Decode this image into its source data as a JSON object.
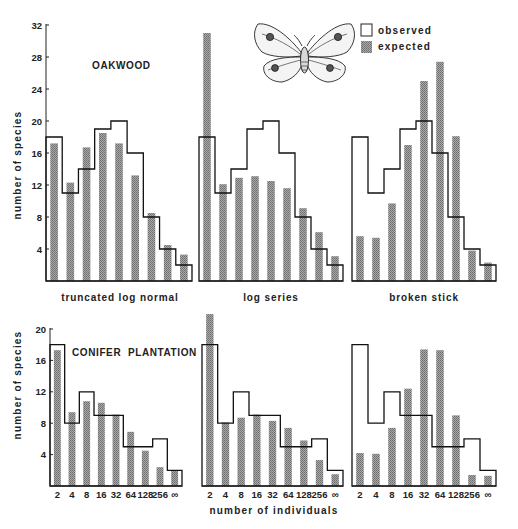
{
  "figure": {
    "top_caption_partial": "",
    "x_axis_title": "number of individuals",
    "y_axis_title": "number of species",
    "footer_caption_partial": ""
  },
  "legend": {
    "observed_label": "observed",
    "expected_label": "expected"
  },
  "rows": [
    {
      "site_label": "OAKWOOD",
      "y_ticks": [
        4,
        8,
        12,
        16,
        20,
        24,
        28,
        32
      ],
      "ymax": 32
    },
    {
      "site_label": "CONIFER  PLANTATION",
      "y_ticks": [
        4,
        8,
        12,
        16,
        20
      ],
      "ymax": 20
    }
  ],
  "model_labels": [
    "truncated log normal",
    "log series",
    "broken stick"
  ],
  "x_tick_labels": [
    "2",
    "4",
    "8",
    "16",
    "32",
    "64",
    "128",
    "256",
    "∞"
  ],
  "colors": {
    "expected_bar": "#8f8f8f",
    "observed_line": "#111111",
    "axis": "#222222"
  },
  "chart_data": [
    {
      "type": "bar",
      "title": "OAKWOOD – truncated log normal",
      "categories": [
        "2",
        "4",
        "8",
        "16",
        "32",
        "64",
        "128",
        "256",
        "∞"
      ],
      "series": [
        {
          "name": "observed",
          "values": [
            18,
            11,
            14,
            19,
            20,
            16,
            8,
            4,
            2
          ]
        },
        {
          "name": "expected",
          "values": [
            17.2,
            12.3,
            16.7,
            18.5,
            17.2,
            13.2,
            8.5,
            4.5,
            3.3
          ]
        }
      ],
      "xlabel": "number of individuals",
      "ylabel": "number of species",
      "ylim": [
        0,
        32
      ]
    },
    {
      "type": "bar",
      "title": "OAKWOOD – log series",
      "categories": [
        "2",
        "4",
        "8",
        "16",
        "32",
        "64",
        "128",
        "256",
        "∞"
      ],
      "series": [
        {
          "name": "observed",
          "values": [
            18,
            11,
            14,
            19,
            20,
            16,
            8,
            4,
            2
          ]
        },
        {
          "name": "expected",
          "values": [
            31,
            12.1,
            12.9,
            13.1,
            12.5,
            11.6,
            9.1,
            6.1,
            3.1
          ]
        }
      ],
      "xlabel": "number of individuals",
      "ylabel": "number of species",
      "ylim": [
        0,
        32
      ]
    },
    {
      "type": "bar",
      "title": "OAKWOOD – broken stick",
      "categories": [
        "2",
        "4",
        "8",
        "16",
        "32",
        "64",
        "128",
        "256",
        "∞"
      ],
      "series": [
        {
          "name": "observed",
          "values": [
            18,
            11,
            14,
            19,
            20,
            16,
            8,
            4,
            2
          ]
        },
        {
          "name": "expected",
          "values": [
            5.6,
            5.4,
            9.7,
            17,
            25,
            27.4,
            18.1,
            3.8,
            2.3
          ]
        }
      ],
      "xlabel": "number of individuals",
      "ylabel": "number of species",
      "ylim": [
        0,
        32
      ]
    },
    {
      "type": "bar",
      "title": "CONIFER PLANTATION – truncated log normal",
      "categories": [
        "2",
        "4",
        "8",
        "16",
        "32",
        "64",
        "128",
        "256",
        "∞"
      ],
      "series": [
        {
          "name": "observed",
          "values": [
            18,
            8,
            12,
            9,
            9,
            5,
            5,
            6,
            2
          ]
        },
        {
          "name": "expected",
          "values": [
            17.3,
            9.4,
            10.8,
            10.6,
            9.1,
            6.9,
            4.5,
            2.4,
            2.0
          ]
        }
      ],
      "xlabel": "number of individuals",
      "ylabel": "number of species",
      "ylim": [
        0,
        20
      ]
    },
    {
      "type": "bar",
      "title": "CONIFER PLANTATION – log series",
      "categories": [
        "2",
        "4",
        "8",
        "16",
        "32",
        "64",
        "128",
        "256",
        "∞"
      ],
      "series": [
        {
          "name": "observed",
          "values": [
            18,
            8,
            12,
            9,
            9,
            5,
            5,
            6,
            2
          ]
        },
        {
          "name": "expected",
          "values": [
            21.9,
            8.1,
            8.7,
            9.1,
            8.3,
            7.4,
            5.8,
            3.3,
            1.5
          ]
        }
      ],
      "xlabel": "number of individuals",
      "ylabel": "number of species",
      "ylim": [
        0,
        20
      ]
    },
    {
      "type": "bar",
      "title": "CONIFER PLANTATION – broken stick",
      "categories": [
        "2",
        "4",
        "8",
        "16",
        "32",
        "64",
        "128",
        "256",
        "∞"
      ],
      "series": [
        {
          "name": "observed",
          "values": [
            18,
            8,
            12,
            9,
            9,
            5,
            5,
            6,
            2
          ]
        },
        {
          "name": "expected",
          "values": [
            4.2,
            4.1,
            7.4,
            12.4,
            17.4,
            17.3,
            9.0,
            1.4,
            1.3
          ]
        }
      ],
      "xlabel": "number of individuals",
      "ylabel": "number of species",
      "ylim": [
        0,
        20
      ]
    }
  ]
}
